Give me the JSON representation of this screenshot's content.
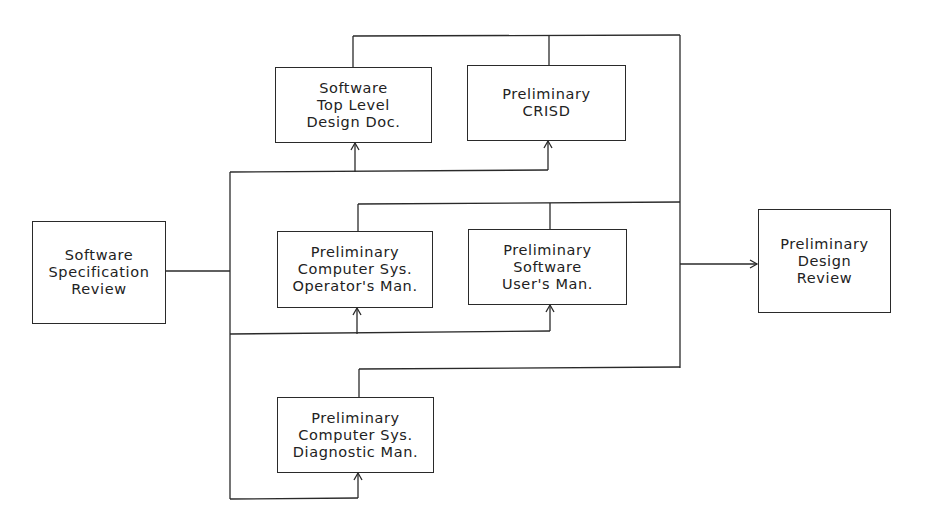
{
  "diagram": {
    "nodes": {
      "ssr": {
        "lines": [
          "Software",
          "Specification",
          "Review"
        ]
      },
      "tld": {
        "lines": [
          "Software",
          "Top Level",
          "Design Doc."
        ]
      },
      "crisd": {
        "lines": [
          "Preliminary",
          "CRISD"
        ]
      },
      "csom": {
        "lines": [
          "Preliminary",
          "Computer Sys.",
          "Operator's Man."
        ]
      },
      "sum": {
        "lines": [
          "Preliminary",
          "Software",
          "User's Man."
        ]
      },
      "csdm": {
        "lines": [
          "Preliminary",
          "Computer Sys.",
          "Diagnostic Man."
        ]
      },
      "pdr": {
        "lines": [
          "Preliminary",
          "Design",
          "Review"
        ]
      }
    },
    "edges": [
      {
        "from": "Software Specification Review",
        "to": "Software Top Level Design Doc."
      },
      {
        "from": "Software Specification Review",
        "to": "Preliminary CRISD"
      },
      {
        "from": "Software Specification Review",
        "to": "Preliminary Computer Sys. Operator's Man."
      },
      {
        "from": "Software Specification Review",
        "to": "Preliminary Software User's Man."
      },
      {
        "from": "Software Specification Review",
        "to": "Preliminary Computer Sys. Diagnostic Man."
      },
      {
        "from": "Software Top Level Design Doc.",
        "to": "Preliminary Design Review"
      },
      {
        "from": "Preliminary CRISD",
        "to": "Preliminary Design Review"
      },
      {
        "from": "Preliminary Computer Sys. Operator's Man.",
        "to": "Preliminary Design Review"
      },
      {
        "from": "Preliminary Software User's Man.",
        "to": "Preliminary Design Review"
      },
      {
        "from": "Preliminary Computer Sys. Diagnostic Man.",
        "to": "Preliminary Design Review"
      }
    ],
    "line_color": "#2a2a2a",
    "text_color": "#222222",
    "background": "#ffffff"
  }
}
